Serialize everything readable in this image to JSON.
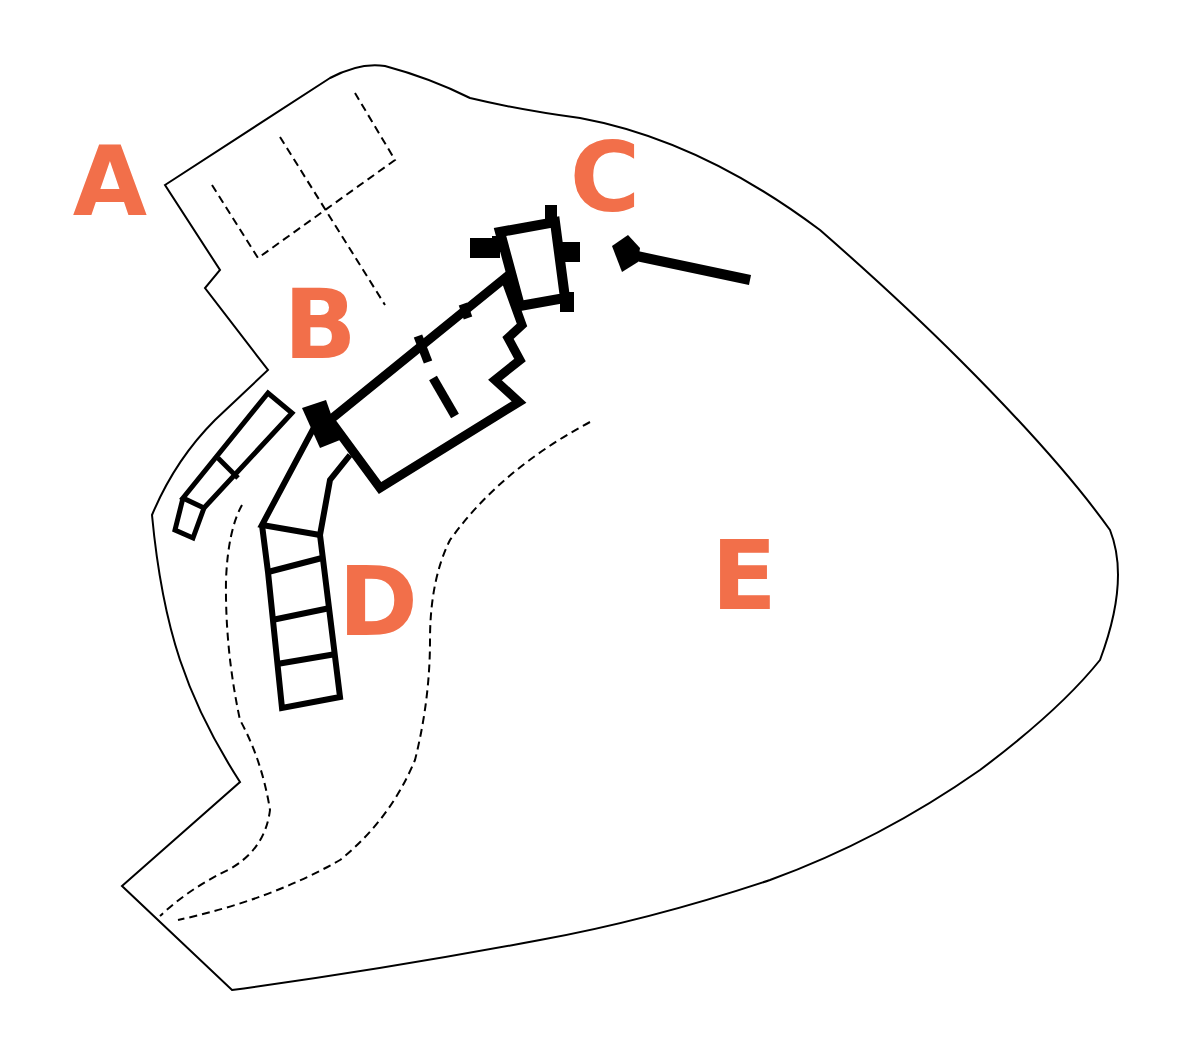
{
  "diagram": {
    "type": "site-plan",
    "label_color": "#f26f4a",
    "line_color": "#000000",
    "background": "#ffffff",
    "labels": [
      {
        "id": "A",
        "text": "A",
        "x": 110,
        "y": 182
      },
      {
        "id": "B",
        "text": "B",
        "x": 320,
        "y": 325
      },
      {
        "id": "C",
        "text": "C",
        "x": 605,
        "y": 178
      },
      {
        "id": "D",
        "text": "D",
        "x": 378,
        "y": 602
      },
      {
        "id": "E",
        "text": "E",
        "x": 744,
        "y": 576
      }
    ],
    "legend": []
  }
}
